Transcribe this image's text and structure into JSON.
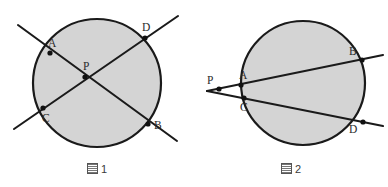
{
  "document": {
    "title": "Two circle geometry figures: intersecting chords and secants from an external point",
    "background_color": "#ffffff",
    "width": 388,
    "height": 187
  },
  "style": {
    "circle_fill": "#d4d4d4",
    "circle_stroke": "#1a1a1a",
    "line_color": "#1a1a1a",
    "point_color": "#111111",
    "label_color": "#2b2b2b",
    "caption_color": "#3a3a3a"
  },
  "figures": [
    {
      "id": "figure-1",
      "caption": {
        "glyph_name": "tofu-box-glyph",
        "number": "1",
        "full_text": "图 1"
      },
      "description": "Circle with two chords AB and CD intersecting at interior point P; both chords extend past the circle.",
      "circle": {
        "cx": 97,
        "cy": 83,
        "r": 64
      },
      "points": [
        {
          "name": "A",
          "x": 50,
          "y": 53,
          "label_dx": -2,
          "label_dy": -15,
          "on_circle": true
        },
        {
          "name": "B",
          "x": 148,
          "y": 124,
          "label_dx": 6,
          "label_dy": -4,
          "on_circle": true
        },
        {
          "name": "C",
          "x": 43,
          "y": 108,
          "label_dx": -1,
          "label_dy": 5,
          "on_circle": true
        },
        {
          "name": "D",
          "x": 145,
          "y": 38,
          "label_dx": -3,
          "label_dy": -16,
          "on_circle": true
        },
        {
          "name": "P",
          "x": 85,
          "y": 77,
          "label_dx": -2,
          "label_dy": -16,
          "on_circle": false
        }
      ],
      "lines": [
        {
          "name": "line-A-B",
          "from": "A",
          "to": "B",
          "x1": 18,
          "y1": 25,
          "x2": 177,
          "y2": 141
        },
        {
          "name": "line-C-D",
          "from": "C",
          "to": "D",
          "x1": 14,
          "y1": 129,
          "x2": 178,
          "y2": 16
        }
      ]
    },
    {
      "id": "figure-2",
      "caption": {
        "glyph_name": "tofu-box-glyph",
        "number": "2",
        "full_text": "图 2"
      },
      "description": "Circle with two secant lines drawn from external point P; one meets the circle at A then B, the other at C then D.",
      "circle": {
        "cx": 303,
        "cy": 83,
        "r": 62
      },
      "points": [
        {
          "name": "P",
          "x": 219,
          "y": 89,
          "label_dx": -12,
          "label_dy": -14,
          "on_circle": false
        },
        {
          "name": "A",
          "x": 241,
          "y": 85,
          "label_dx": -2,
          "label_dy": -15,
          "on_circle": true
        },
        {
          "name": "B",
          "x": 362,
          "y": 60,
          "label_dx": -13,
          "label_dy": -14,
          "on_circle": true
        },
        {
          "name": "C",
          "x": 244,
          "y": 98,
          "label_dx": -4,
          "label_dy": 4,
          "on_circle": true
        },
        {
          "name": "D",
          "x": 363,
          "y": 122,
          "label_dx": -14,
          "label_dy": 2,
          "on_circle": true
        }
      ],
      "lines": [
        {
          "name": "secant-P-A-B",
          "from": "P",
          "to": "B",
          "x1": 207,
          "y1": 91,
          "x2": 383,
          "y2": 55
        },
        {
          "name": "secant-P-C-D",
          "from": "P",
          "to": "D",
          "x1": 207,
          "y1": 91,
          "x2": 383,
          "y2": 126
        }
      ]
    }
  ]
}
